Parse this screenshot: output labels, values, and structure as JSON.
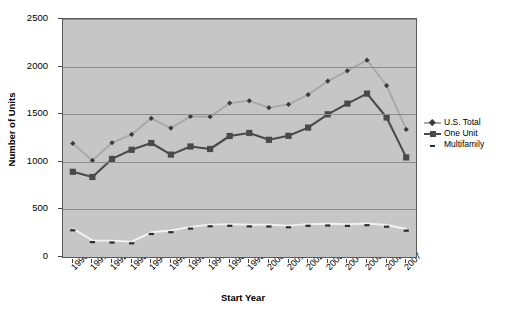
{
  "chart_data": {
    "type": "line",
    "title": "",
    "xlabel": "Start Year",
    "ylabel": "Number of Units",
    "categories": [
      "1990",
      "1991",
      "1992",
      "1993",
      "1994",
      "1995",
      "1996",
      "1997",
      "1998",
      "1999",
      "2000",
      "2001",
      "2002",
      "2003",
      "2004",
      "2005",
      "2006",
      "2007"
    ],
    "ylim": [
      0,
      2500
    ],
    "yticks": [
      0,
      500,
      1000,
      1500,
      2000,
      2500
    ],
    "ytick_labels": [
      "0",
      "500",
      "1000",
      "1500",
      "2000",
      "2500"
    ],
    "grid": true,
    "legend_position": "right",
    "series": [
      {
        "name": "U.S. Total",
        "color": "#a8a8a8",
        "values": [
          1193,
          1014,
          1200,
          1288,
          1457,
          1354,
          1477,
          1474,
          1617,
          1641,
          1569,
          1603,
          1705,
          1848,
          1956,
          2068,
          1801,
          1340
        ]
      },
      {
        "name": "One Unit",
        "color": "#4a4a4a",
        "values": [
          895,
          840,
          1030,
          1126,
          1198,
          1076,
          1161,
          1134,
          1271,
          1302,
          1231,
          1273,
          1359,
          1499,
          1611,
          1716,
          1465,
          1046
        ]
      },
      {
        "name": "Multifamily",
        "color": "#f2f2f2",
        "values": [
          298,
          174,
          170,
          162,
          259,
          278,
          316,
          340,
          346,
          339,
          338,
          330,
          346,
          349,
          345,
          352,
          336,
          294
        ]
      }
    ]
  },
  "legend": {
    "items": [
      {
        "label": "U.S. Total"
      },
      {
        "label": "One Unit"
      },
      {
        "label": "Multifamily"
      }
    ]
  },
  "axes": {
    "y_title": "Number of Units",
    "x_title": "Start Year"
  }
}
